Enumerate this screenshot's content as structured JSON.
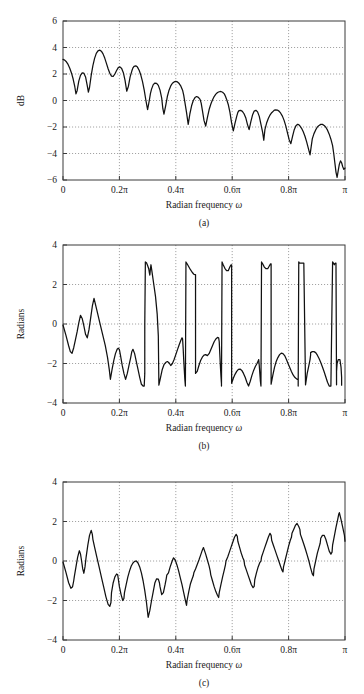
{
  "figure": {
    "background": "#ffffff",
    "line_color": "#111111",
    "grid_color": "#8c8c8c",
    "axis_color": "#3a3a3a"
  },
  "chart_data": [
    {
      "id": "panel-a",
      "type": "line",
      "title": "",
      "caption": "(a)",
      "xlabel": "Radian frequency ω",
      "ylabel": "dB",
      "xlim": [
        0,
        1
      ],
      "ylim": [
        -6,
        6
      ],
      "grid": true,
      "legend": null,
      "xticks": [
        0,
        0.2,
        0.4,
        0.6,
        0.8,
        1
      ],
      "xticklabels": [
        "0",
        "0.2π",
        "0.4π",
        "0.6π",
        "0.8π",
        "π"
      ],
      "yticks": [
        -6,
        -4,
        -2,
        0,
        2,
        4,
        6
      ],
      "yticklabels": [
        "−6",
        "−4",
        "−2",
        "0",
        "2",
        "4",
        "6"
      ],
      "x": [
        0.0,
        0.006,
        0.012,
        0.018,
        0.024,
        0.03,
        0.036,
        0.042,
        0.046,
        0.05,
        0.056,
        0.062,
        0.068,
        0.074,
        0.08,
        0.086,
        0.09,
        0.094,
        0.1,
        0.106,
        0.112,
        0.118,
        0.124,
        0.13,
        0.136,
        0.142,
        0.148,
        0.154,
        0.16,
        0.166,
        0.172,
        0.178,
        0.184,
        0.19,
        0.196,
        0.202,
        0.208,
        0.214,
        0.22,
        0.226,
        0.232,
        0.238,
        0.244,
        0.248,
        0.252,
        0.258,
        0.264,
        0.27,
        0.276,
        0.282,
        0.288,
        0.294,
        0.3,
        0.306,
        0.31,
        0.314,
        0.32,
        0.326,
        0.332,
        0.338,
        0.344,
        0.35,
        0.354,
        0.358,
        0.364,
        0.37,
        0.376,
        0.382,
        0.388,
        0.394,
        0.4,
        0.406,
        0.412,
        0.418,
        0.424,
        0.428,
        0.432,
        0.438,
        0.444,
        0.45,
        0.456,
        0.462,
        0.468,
        0.474,
        0.48,
        0.486,
        0.49,
        0.494,
        0.5,
        0.506,
        0.512,
        0.518,
        0.524,
        0.53,
        0.536,
        0.542,
        0.548,
        0.554,
        0.56,
        0.566,
        0.572,
        0.576,
        0.58,
        0.586,
        0.592,
        0.598,
        0.604,
        0.61,
        0.616,
        0.62,
        0.624,
        0.63,
        0.636,
        0.642,
        0.648,
        0.654,
        0.66,
        0.666,
        0.672,
        0.678,
        0.684,
        0.69,
        0.696,
        0.702,
        0.708,
        0.712,
        0.716,
        0.722,
        0.728,
        0.734,
        0.74,
        0.746,
        0.75,
        0.754,
        0.76,
        0.766,
        0.772,
        0.778,
        0.784,
        0.79,
        0.796,
        0.802,
        0.808,
        0.814,
        0.82,
        0.826,
        0.832,
        0.836,
        0.84,
        0.846,
        0.852,
        0.858,
        0.864,
        0.87,
        0.876,
        0.88,
        0.884,
        0.89,
        0.896,
        0.902,
        0.908,
        0.914,
        0.92,
        0.926,
        0.932,
        0.938,
        0.944,
        0.95,
        0.956,
        0.96,
        0.964,
        0.968,
        0.972,
        0.976,
        0.98,
        0.984,
        0.988,
        0.992,
        0.996,
        1.0
      ],
      "y": [
        3.1,
        3.05,
        2.92,
        2.72,
        2.44,
        2.08,
        1.62,
        1.02,
        0.5,
        0.74,
        1.46,
        1.9,
        2.08,
        2.06,
        1.78,
        1.12,
        0.64,
        0.98,
        1.9,
        2.64,
        3.18,
        3.56,
        3.74,
        3.8,
        3.72,
        3.52,
        3.2,
        2.8,
        2.4,
        2.06,
        1.84,
        1.82,
        2.0,
        2.26,
        2.48,
        2.54,
        2.42,
        2.1,
        1.52,
        0.7,
        1.08,
        1.78,
        2.22,
        2.46,
        2.58,
        2.62,
        2.52,
        2.28,
        1.92,
        1.42,
        0.78,
        0.0,
        -0.68,
        0.0,
        0.52,
        0.86,
        1.2,
        1.32,
        1.3,
        1.14,
        0.78,
        0.18,
        -0.6,
        -1.02,
        -0.4,
        0.3,
        0.78,
        1.1,
        1.3,
        1.4,
        1.44,
        1.4,
        1.28,
        1.08,
        0.78,
        0.4,
        -0.1,
        -0.9,
        -1.8,
        -1.0,
        -0.4,
        0.0,
        0.22,
        0.3,
        0.24,
        0.08,
        -0.2,
        -0.7,
        -1.5,
        -1.94,
        -1.3,
        -0.7,
        -0.28,
        0.04,
        0.3,
        0.48,
        0.6,
        0.66,
        0.68,
        0.62,
        0.5,
        0.32,
        0.1,
        -0.3,
        -0.9,
        -1.7,
        -2.3,
        -1.7,
        -1.2,
        -0.9,
        -0.76,
        -0.74,
        -0.82,
        -1.0,
        -1.3,
        -1.8,
        -2.2,
        -1.62,
        -1.1,
        -0.8,
        -0.74,
        -0.86,
        -1.2,
        -1.8,
        -2.4,
        -3.0,
        -2.2,
        -1.7,
        -1.36,
        -1.1,
        -0.92,
        -0.8,
        -0.72,
        -0.7,
        -0.72,
        -0.8,
        -0.96,
        -1.18,
        -1.5,
        -1.92,
        -2.44,
        -2.96,
        -3.26,
        -2.7,
        -2.2,
        -1.9,
        -1.8,
        -1.82,
        -1.92,
        -2.1,
        -2.36,
        -2.7,
        -3.12,
        -3.62,
        -4.1,
        -3.5,
        -2.9,
        -2.5,
        -2.22,
        -2.0,
        -1.88,
        -1.8,
        -1.8,
        -1.88,
        -2.02,
        -2.24,
        -2.54,
        -2.92,
        -3.4,
        -4.0,
        -4.7,
        -5.4,
        -5.8,
        -5.3,
        -4.8,
        -4.56,
        -4.7,
        -5.0,
        -5.2,
        -5.1
      ]
    },
    {
      "id": "panel-b",
      "type": "line",
      "title": "",
      "caption": "(b)",
      "xlabel": "Radian frequency ω",
      "ylabel": "Radians",
      "xlim": [
        0,
        1
      ],
      "ylim": [
        -4,
        4
      ],
      "grid": true,
      "legend": null,
      "xticks": [
        0,
        0.2,
        0.4,
        0.6,
        0.8,
        1
      ],
      "xticklabels": [
        "0",
        "0.2π",
        "0.4π",
        "0.6π",
        "0.8π",
        "π"
      ],
      "yticks": [
        -4,
        -2,
        0,
        2,
        4
      ],
      "yticklabels": [
        "−4",
        "−2",
        "0",
        "2",
        "4"
      ],
      "wrapped": true,
      "x": [
        0.0,
        0.01,
        0.02,
        0.026,
        0.032,
        0.038,
        0.044,
        0.05,
        0.056,
        0.062,
        0.068,
        0.074,
        0.08,
        0.086,
        0.092,
        0.098,
        0.104,
        0.11,
        0.12,
        0.13,
        0.14,
        0.15,
        0.158,
        0.164,
        0.168,
        0.168,
        0.174,
        0.18,
        0.186,
        0.192,
        0.196,
        0.2,
        0.204,
        0.204,
        0.21,
        0.216,
        0.222,
        0.228,
        0.234,
        0.24,
        0.244,
        0.248,
        0.248,
        0.254,
        0.26,
        0.266,
        0.272,
        0.278,
        0.284,
        0.288,
        0.29,
        0.29,
        0.292,
        0.292,
        0.296,
        0.3,
        0.304,
        0.306,
        0.308,
        0.308,
        0.31,
        0.31,
        0.312,
        0.316,
        0.322,
        0.328,
        0.334,
        0.338,
        0.34,
        0.34,
        0.346,
        0.352,
        0.358,
        0.364,
        0.37,
        0.376,
        0.382,
        0.388,
        0.394,
        0.4,
        0.406,
        0.412,
        0.418,
        0.422,
        0.424,
        0.424,
        0.426,
        0.428,
        0.43,
        0.432,
        0.434,
        0.434,
        0.436,
        0.44,
        0.446,
        0.452,
        0.458,
        0.464,
        0.468,
        0.47,
        0.47,
        0.476,
        0.482,
        0.488,
        0.494,
        0.5,
        0.506,
        0.512,
        0.518,
        0.524,
        0.53,
        0.536,
        0.542,
        0.548,
        0.552,
        0.554,
        0.554,
        0.556,
        0.558,
        0.56,
        0.562,
        0.562,
        0.564,
        0.568,
        0.574,
        0.58,
        0.586,
        0.592,
        0.596,
        0.598,
        0.598,
        0.604,
        0.61,
        0.616,
        0.622,
        0.628,
        0.634,
        0.64,
        0.646,
        0.652,
        0.658,
        0.664,
        0.67,
        0.676,
        0.682,
        0.688,
        0.692,
        0.694,
        0.694,
        0.696,
        0.698,
        0.7,
        0.702,
        0.702,
        0.704,
        0.708,
        0.714,
        0.72,
        0.726,
        0.732,
        0.736,
        0.738,
        0.738,
        0.744,
        0.75,
        0.756,
        0.762,
        0.768,
        0.774,
        0.78,
        0.786,
        0.792,
        0.798,
        0.804,
        0.81,
        0.816,
        0.822,
        0.828,
        0.832,
        0.834,
        0.834,
        0.836,
        0.838,
        0.84,
        0.842,
        0.842,
        0.844,
        0.848,
        0.854,
        0.86,
        0.866,
        0.872,
        0.876,
        0.878,
        0.878,
        0.884,
        0.89,
        0.896,
        0.902,
        0.908,
        0.914,
        0.92,
        0.926,
        0.932,
        0.938,
        0.944,
        0.95,
        0.956,
        0.96,
        0.962,
        0.962,
        0.964,
        0.966,
        0.968,
        0.97,
        0.97,
        0.972,
        0.976,
        0.982,
        0.986,
        0.988,
        0.988,
        0.99,
        0.994,
        1.0
      ],
      "y": [
        -0.05,
        -0.55,
        -1.1,
        -1.4,
        -1.48,
        -1.2,
        -0.8,
        -0.4,
        0.06,
        0.44,
        0.28,
        -0.1,
        -0.52,
        -0.7,
        -0.3,
        0.3,
        0.9,
        1.3,
        0.7,
        0.1,
        -0.5,
        -1.1,
        -1.7,
        -2.3,
        -2.8,
        -2.8,
        -2.3,
        -1.85,
        -1.5,
        -1.28,
        -1.22,
        -1.3,
        -1.6,
        -1.6,
        -2.1,
        -2.5,
        -2.8,
        -2.5,
        -2.1,
        -1.7,
        -1.4,
        -1.28,
        -1.28,
        -1.5,
        -1.9,
        -2.3,
        -2.7,
        -3.05,
        -3.14,
        -3.14,
        -2.5,
        0.0,
        3.0,
        3.14,
        3.1,
        2.96,
        2.8,
        2.62,
        2.48,
        2.48,
        2.8,
        2.8,
        3.0,
        2.6,
        2.0,
        1.4,
        0.5,
        -0.6,
        -3.1,
        -3.1,
        -2.7,
        -2.3,
        -2.06,
        -1.95,
        -1.9,
        -1.96,
        -2.1,
        -2.0,
        -1.8,
        -1.55,
        -1.3,
        -1.05,
        -0.82,
        -0.7,
        -0.75,
        -0.75,
        -1.2,
        -1.8,
        -2.3,
        -2.8,
        -3.14,
        -3.14,
        3.14,
        3.05,
        2.9,
        2.75,
        2.62,
        2.52,
        2.5,
        2.5,
        -2.5,
        -2.4,
        -2.1,
        -1.85,
        -1.68,
        -1.58,
        -1.55,
        -1.6,
        -1.5,
        -1.3,
        -1.1,
        -0.9,
        -0.76,
        -0.68,
        -0.7,
        -0.9,
        -0.9,
        -1.5,
        -2.1,
        -2.6,
        -3.05,
        -3.14,
        3.14,
        3.0,
        2.82,
        2.7,
        2.7,
        2.9,
        3.0,
        3.0,
        -3.0,
        -2.75,
        -2.55,
        -2.4,
        -2.3,
        -2.28,
        -2.35,
        -2.5,
        -2.7,
        -2.95,
        -3.14,
        -2.9,
        -2.6,
        -2.35,
        -2.15,
        -2.0,
        -1.88,
        -1.8,
        -1.8,
        -2.1,
        -2.5,
        -2.9,
        -3.14,
        -3.14,
        3.14,
        3.05,
        2.88,
        2.8,
        2.8,
        2.95,
        3.05,
        3.05,
        -3.05,
        -2.6,
        -2.2,
        -1.9,
        -1.7,
        -1.55,
        -1.48,
        -1.5,
        -1.6,
        -1.78,
        -2.0,
        -2.2,
        -2.4,
        -2.58,
        -2.7,
        -2.78,
        -2.8,
        -2.8,
        -3.14,
        3.14,
        3.1,
        3.08,
        3.08,
        3.08,
        3.08,
        3.08,
        3.08,
        -3.08,
        -2.5,
        -2.1,
        -1.8,
        -1.58,
        -1.45,
        -1.4,
        -1.4,
        -1.45,
        -1.58,
        -1.75,
        -1.95,
        -2.18,
        -2.42,
        -2.68,
        -2.95,
        -3.14,
        -3.14,
        3.14,
        3.06,
        3.0,
        3.0,
        3.05,
        3.08,
        3.08,
        -3.08,
        -2.4,
        -2.0,
        -1.8,
        -1.8,
        -2.2,
        -2.7,
        -3.1
      ]
    },
    {
      "id": "panel-c",
      "type": "line",
      "title": "",
      "caption": "(c)",
      "xlabel": "Radian frequency ω",
      "ylabel": "Radians",
      "xlim": [
        0,
        1
      ],
      "ylim": [
        -4,
        4
      ],
      "grid": true,
      "legend": null,
      "xticks": [
        0,
        0.2,
        0.4,
        0.6,
        0.8,
        1
      ],
      "xticklabels": [
        "0",
        "0.2π",
        "0.4π",
        "0.6π",
        "0.8π",
        "π"
      ],
      "yticks": [
        -4,
        -2,
        0,
        2,
        4
      ],
      "yticklabels": [
        "−4",
        "−2",
        "0",
        "2",
        "4"
      ],
      "wrapped": false,
      "x": [
        0.0,
        0.01,
        0.02,
        0.028,
        0.034,
        0.038,
        0.04,
        0.046,
        0.052,
        0.058,
        0.062,
        0.066,
        0.07,
        0.074,
        0.078,
        0.082,
        0.088,
        0.094,
        0.1,
        0.104,
        0.106,
        0.112,
        0.12,
        0.128,
        0.136,
        0.144,
        0.152,
        0.16,
        0.166,
        0.17,
        0.172,
        0.178,
        0.184,
        0.19,
        0.194,
        0.196,
        0.2,
        0.206,
        0.212,
        0.216,
        0.218,
        0.224,
        0.23,
        0.236,
        0.242,
        0.248,
        0.254,
        0.26,
        0.266,
        0.272,
        0.278,
        0.284,
        0.29,
        0.296,
        0.3,
        0.302,
        0.308,
        0.314,
        0.32,
        0.324,
        0.326,
        0.332,
        0.338,
        0.342,
        0.344,
        0.35,
        0.356,
        0.362,
        0.366,
        0.368,
        0.374,
        0.38,
        0.386,
        0.39,
        0.392,
        0.398,
        0.404,
        0.41,
        0.416,
        0.422,
        0.428,
        0.434,
        0.438,
        0.44,
        0.446,
        0.452,
        0.458,
        0.462,
        0.464,
        0.47,
        0.476,
        0.482,
        0.488,
        0.494,
        0.498,
        0.5,
        0.506,
        0.512,
        0.518,
        0.522,
        0.524,
        0.53,
        0.536,
        0.542,
        0.548,
        0.552,
        0.554,
        0.56,
        0.566,
        0.572,
        0.576,
        0.578,
        0.584,
        0.59,
        0.596,
        0.602,
        0.608,
        0.614,
        0.618,
        0.62,
        0.626,
        0.632,
        0.638,
        0.642,
        0.644,
        0.65,
        0.656,
        0.662,
        0.668,
        0.674,
        0.678,
        0.68,
        0.686,
        0.692,
        0.698,
        0.702,
        0.704,
        0.71,
        0.716,
        0.722,
        0.728,
        0.734,
        0.738,
        0.74,
        0.746,
        0.752,
        0.758,
        0.764,
        0.77,
        0.776,
        0.78,
        0.782,
        0.788,
        0.794,
        0.8,
        0.806,
        0.81,
        0.812,
        0.818,
        0.824,
        0.83,
        0.836,
        0.84,
        0.842,
        0.848,
        0.854,
        0.86,
        0.866,
        0.872,
        0.878,
        0.884,
        0.888,
        0.89,
        0.896,
        0.902,
        0.908,
        0.912,
        0.914,
        0.92,
        0.926,
        0.932,
        0.938,
        0.944,
        0.95,
        0.954,
        0.956,
        0.962,
        0.968,
        0.974,
        0.978,
        0.98,
        0.986,
        0.992,
        0.998,
        1.0
      ],
      "y": [
        -0.05,
        -0.55,
        -1.1,
        -1.38,
        -1.3,
        -1.0,
        -0.8,
        -0.3,
        0.2,
        0.52,
        0.36,
        0.0,
        -0.4,
        -0.62,
        -0.3,
        0.2,
        0.8,
        1.3,
        1.55,
        1.35,
        1.1,
        0.7,
        0.2,
        -0.3,
        -0.8,
        -1.3,
        -1.8,
        -2.2,
        -2.3,
        -2.1,
        -1.6,
        -1.1,
        -0.8,
        -0.66,
        -0.7,
        -0.9,
        -1.3,
        -1.7,
        -2.0,
        -1.9,
        -1.6,
        -1.2,
        -0.8,
        -0.5,
        -0.25,
        -0.1,
        -0.02,
        0.0,
        -0.1,
        -0.3,
        -0.6,
        -1.0,
        -1.5,
        -2.1,
        -2.6,
        -2.85,
        -2.5,
        -2.0,
        -1.55,
        -1.25,
        -1.1,
        -0.9,
        -0.92,
        -1.1,
        -1.3,
        -1.7,
        -1.6,
        -1.2,
        -0.9,
        -0.72,
        -0.6,
        -0.3,
        -0.05,
        0.1,
        0.16,
        0.05,
        -0.2,
        -0.5,
        -0.85,
        -1.2,
        -1.6,
        -2.0,
        -2.25,
        -2.0,
        -1.55,
        -1.15,
        -0.9,
        -0.75,
        -0.6,
        -0.4,
        -0.18,
        0.05,
        0.3,
        0.55,
        0.68,
        0.6,
        0.35,
        0.05,
        -0.25,
        -0.5,
        -0.7,
        -1.0,
        -1.3,
        -1.55,
        -1.75,
        -1.85,
        -1.6,
        -1.2,
        -0.8,
        -0.45,
        -0.2,
        0.0,
        0.2,
        0.45,
        0.7,
        0.95,
        1.2,
        1.35,
        1.25,
        1.0,
        0.7,
        0.4,
        0.15,
        0.02,
        -0.2,
        -0.45,
        -0.7,
        -0.95,
        -1.2,
        -1.35,
        -1.28,
        -0.95,
        -0.6,
        -0.3,
        -0.08,
        0.0,
        0.2,
        0.45,
        0.7,
        0.95,
        1.2,
        1.4,
        1.3,
        1.05,
        0.8,
        0.55,
        0.3,
        0.05,
        -0.2,
        -0.45,
        -0.55,
        -0.3,
        0.05,
        0.4,
        0.75,
        1.05,
        1.2,
        1.4,
        1.6,
        1.8,
        1.9,
        1.75,
        1.6,
        1.35,
        1.1,
        0.85,
        0.58,
        0.3,
        0.0,
        -0.35,
        -0.65,
        -0.75,
        -0.4,
        0.0,
        0.4,
        0.7,
        0.9,
        1.15,
        1.3,
        1.3,
        1.1,
        0.8,
        0.5,
        0.35,
        0.45,
        0.8,
        1.25,
        1.7,
        2.1,
        2.38,
        2.45,
        2.1,
        1.7,
        1.3,
        1.0,
        0.9,
        0.6,
        0.25,
        -0.1,
        -0.35,
        -0.55,
        -0.4,
        0.0,
        0.5,
        1.0,
        1.4,
        1.55,
        1.3,
        0.9,
        0.4,
        0.0
      ]
    }
  ]
}
